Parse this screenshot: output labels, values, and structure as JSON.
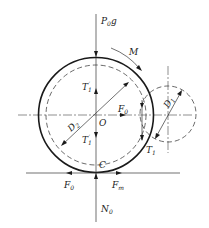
{
  "figure": {
    "labels": {
      "weight": {
        "main": "P",
        "sub": "0",
        "tail": "g"
      },
      "moment": "M",
      "tension_upper": {
        "main": "T",
        "sub": "1",
        "prime": "′"
      },
      "tension_lower": {
        "main": "T",
        "sub": "1",
        "prime": "′"
      },
      "center_force": {
        "main": "F",
        "sub": "0"
      },
      "center": "O",
      "large_diameter": {
        "main": "D",
        "sub": "2"
      },
      "small_diameter": {
        "main": "D",
        "sub": "1"
      },
      "contact_tension": {
        "main": "T",
        "sub": "1"
      },
      "contact_point": "C",
      "ground_force_left": {
        "main": "F",
        "sub": "0"
      },
      "ground_force_right": {
        "main": "F",
        "sub": "m"
      },
      "normal_force": {
        "main": "N",
        "sub": "0"
      }
    },
    "colors": {
      "stroke": "#1a1a1a",
      "background": "#ffffff"
    }
  }
}
